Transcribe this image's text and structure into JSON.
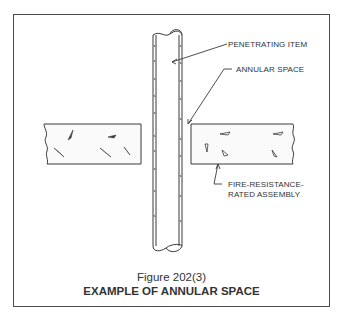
{
  "figure": {
    "number_label": "Figure 202(3)",
    "title": "EXAMPLE OF ANNULAR SPACE"
  },
  "callouts": {
    "penetrating_item": "PENETRATING ITEM",
    "annular_space": "ANNULAR SPACE",
    "assembly_line1": "FIRE-RESISTANCE-",
    "assembly_line2": "RATED ASSEMBLY"
  },
  "diagram": {
    "elements": [
      "penetrating-pipe",
      "left-wall-section",
      "right-wall-section",
      "annular-gap"
    ],
    "line_color": "#3a3a3a"
  }
}
